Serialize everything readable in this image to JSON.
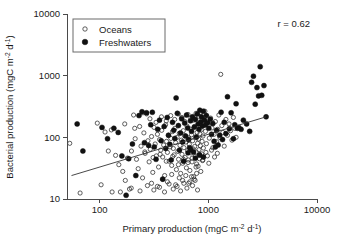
{
  "chart_data": {
    "type": "scatter",
    "title": "",
    "xlabel": "Primary production (mgC m-2 d-1)",
    "ylabel": "Bacterial production (mgC m-2 d-1)",
    "xlabel_parts": {
      "main": "Primary production (mgC m",
      "sup1": "-2",
      "mid": " d",
      "sup2": "-1",
      "end": ")"
    },
    "ylabel_parts": {
      "main": "Bacterial production (mgC m",
      "sup1": "-2",
      "mid": " d",
      "sup2": "-1",
      "end": ")"
    },
    "xscale": "log",
    "yscale": "log",
    "xlim": [
      50,
      10000
    ],
    "ylim": [
      10,
      10000
    ],
    "xticks": [
      100,
      1000,
      10000
    ],
    "xtick_labels": [
      "100",
      "1000",
      "10000"
    ],
    "yticks": [
      10,
      100,
      1000,
      10000
    ],
    "ytick_labels": [
      "10",
      "100",
      "1000",
      "10000"
    ],
    "grid": false,
    "legend_position": "top-left",
    "annotation": "r = 0.62",
    "correlation_r": 0.62,
    "marker_colors": {
      "oceans": "#ffffff",
      "freshwaters": "#111111",
      "edge": "#2b2b2b",
      "fitline": "#333333"
    },
    "fit_line": {
      "x": [
        55,
        3400
      ],
      "y": [
        24,
        215
      ],
      "label": "regression line"
    },
    "series": [
      {
        "name": "Oceans",
        "marker": "open-circle",
        "points": [
          [
            53,
            80
          ],
          [
            66,
            12.5
          ],
          [
            95,
            170
          ],
          [
            103,
            17
          ],
          [
            112,
            122
          ],
          [
            120,
            60
          ],
          [
            128,
            132
          ],
          [
            140,
            51
          ],
          [
            150,
            36
          ],
          [
            163,
            28
          ],
          [
            172,
            20
          ],
          [
            180,
            46
          ],
          [
            188,
            14.5
          ],
          [
            196,
            60
          ],
          [
            205,
            230
          ],
          [
            212,
            95
          ],
          [
            218,
            44
          ],
          [
            226,
            31
          ],
          [
            233,
            150
          ],
          [
            240,
            72
          ],
          [
            248,
            22
          ],
          [
            255,
            118
          ],
          [
            262,
            55
          ],
          [
            270,
            240
          ],
          [
            278,
            88
          ],
          [
            285,
            40
          ],
          [
            292,
            64
          ],
          [
            300,
            103
          ],
          [
            308,
            27
          ],
          [
            316,
            145
          ],
          [
            324,
            78
          ],
          [
            332,
            50
          ],
          [
            340,
            112
          ],
          [
            348,
            33
          ],
          [
            356,
            92
          ],
          [
            364,
            62
          ],
          [
            372,
            130
          ],
          [
            380,
            48
          ],
          [
            388,
            75
          ],
          [
            396,
            24
          ],
          [
            404,
            160
          ],
          [
            412,
            86
          ],
          [
            420,
            57
          ],
          [
            428,
            108
          ],
          [
            436,
            41
          ],
          [
            444,
            70
          ],
          [
            452,
            96
          ],
          [
            460,
            35
          ],
          [
            468,
            124
          ],
          [
            476,
            66
          ],
          [
            484,
            52
          ],
          [
            492,
            140
          ],
          [
            500,
            82
          ],
          [
            508,
            30
          ],
          [
            516,
            100
          ],
          [
            524,
            59
          ],
          [
            532,
            44
          ],
          [
            540,
            116
          ],
          [
            548,
            74
          ],
          [
            556,
            26
          ],
          [
            564,
            90
          ],
          [
            572,
            53
          ],
          [
            580,
            38
          ],
          [
            588,
            128
          ],
          [
            596,
            68
          ],
          [
            604,
            106
          ],
          [
            612,
            47
          ],
          [
            620,
            84
          ],
          [
            628,
            32
          ],
          [
            636,
            152
          ],
          [
            644,
            61
          ],
          [
            652,
            43
          ],
          [
            660,
            98
          ],
          [
            668,
            77
          ],
          [
            676,
            29
          ],
          [
            684,
            136
          ],
          [
            692,
            56
          ],
          [
            700,
            110
          ],
          [
            708,
            40
          ],
          [
            716,
            88
          ],
          [
            724,
            65
          ],
          [
            732,
            23
          ],
          [
            740,
            144
          ],
          [
            748,
            71
          ],
          [
            756,
            49
          ],
          [
            764,
            102
          ],
          [
            772,
            58
          ],
          [
            780,
            37
          ],
          [
            788,
            120
          ],
          [
            796,
            80
          ],
          [
            804,
            34
          ],
          [
            812,
            94
          ],
          [
            820,
            63
          ],
          [
            828,
            45
          ],
          [
            836,
            114
          ],
          [
            844,
            73
          ],
          [
            852,
            28
          ],
          [
            860,
            132
          ],
          [
            868,
            54
          ],
          [
            876,
            86
          ],
          [
            884,
            42
          ],
          [
            892,
            105
          ],
          [
            900,
            67
          ],
          [
            920,
            190
          ],
          [
            940,
            125
          ],
          [
            960,
            79
          ],
          [
            980,
            50
          ],
          [
            1000,
            160
          ],
          [
            1020,
            97
          ],
          [
            1050,
            205
          ],
          [
            1080,
            142
          ],
          [
            1100,
            68
          ],
          [
            1130,
            112
          ],
          [
            1160,
            180
          ],
          [
            1190,
            85
          ],
          [
            1220,
            135
          ],
          [
            1250,
            230
          ],
          [
            1280,
            99
          ],
          [
            1300,
            1050
          ],
          [
            1330,
            155
          ],
          [
            1360,
            120
          ],
          [
            1400,
            72
          ],
          [
            1450,
            195
          ],
          [
            1500,
            108
          ],
          [
            1550,
            165
          ],
          [
            1600,
            128
          ],
          [
            1650,
            90
          ],
          [
            1700,
            210
          ],
          [
            1750,
            140
          ],
          [
            1800,
            100
          ],
          [
            300,
            18
          ],
          [
            340,
            16
          ],
          [
            380,
            21
          ],
          [
            420,
            19
          ],
          [
            460,
            25
          ],
          [
            500,
            17
          ],
          [
            540,
            22
          ],
          [
            580,
            20
          ],
          [
            620,
            24
          ],
          [
            660,
            18
          ],
          [
            700,
            23
          ],
          [
            740,
            21
          ],
          [
            780,
            26
          ],
          [
            250,
            250
          ],
          [
            290,
            200
          ],
          [
            330,
            175
          ],
          [
            370,
            215
          ],
          [
            410,
            185
          ],
          [
            450,
            225
          ],
          [
            490,
            195
          ],
          [
            530,
            240
          ],
          [
            570,
            210
          ],
          [
            610,
            180
          ],
          [
            650,
            235
          ],
          [
            690,
            205
          ],
          [
            730,
            190
          ],
          [
            770,
            245
          ],
          [
            810,
            220
          ],
          [
            850,
            255
          ],
          [
            890,
            198
          ],
          [
            930,
            265
          ],
          [
            155,
            13
          ],
          [
            195,
            15
          ],
          [
            235,
            13.5
          ],
          [
            275,
            16.5
          ],
          [
            315,
            14
          ],
          [
            355,
            15.5
          ],
          [
            395,
            13
          ],
          [
            435,
            17.5
          ],
          [
            475,
            14.5
          ],
          [
            515,
            16
          ],
          [
            555,
            13.5
          ],
          [
            595,
            18
          ],
          [
            635,
            15
          ],
          [
            675,
            19
          ],
          [
            715,
            16.5
          ],
          [
            755,
            20
          ],
          [
            795,
            14
          ],
          [
            130,
            13
          ],
          [
            170,
            165
          ],
          [
            210,
            140
          ],
          [
            260,
            58
          ],
          [
            310,
            47
          ],
          [
            360,
            53
          ],
          [
            410,
            41
          ],
          [
            470,
            49
          ],
          [
            530,
            36
          ],
          [
            590,
            44
          ],
          [
            650,
            39
          ],
          [
            710,
            46
          ],
          [
            770,
            33
          ],
          [
            830,
            51
          ],
          [
            890,
            43
          ],
          [
            950,
            57
          ],
          [
            1010,
            38
          ],
          [
            1070,
            62
          ],
          [
            1140,
            48
          ],
          [
            1210,
            55
          ]
        ]
      },
      {
        "name": "Freshwaters",
        "marker": "filled-circle",
        "points": [
          [
            62,
            165
          ],
          [
            70,
            60
          ],
          [
            105,
            145
          ],
          [
            118,
            95
          ],
          [
            135,
            140
          ],
          [
            148,
            120
          ],
          [
            160,
            50
          ],
          [
            175,
            11.5
          ],
          [
            185,
            45
          ],
          [
            200,
            78
          ],
          [
            215,
            24
          ],
          [
            230,
            225
          ],
          [
            245,
            260
          ],
          [
            258,
            82
          ],
          [
            270,
            250
          ],
          [
            282,
            74
          ],
          [
            295,
            160
          ],
          [
            305,
            255
          ],
          [
            318,
            70
          ],
          [
            330,
            44
          ],
          [
            342,
            135
          ],
          [
            355,
            190
          ],
          [
            368,
            88
          ],
          [
            380,
            21
          ],
          [
            392,
            150
          ],
          [
            405,
            66
          ],
          [
            418,
            210
          ],
          [
            430,
            108
          ],
          [
            442,
            77
          ],
          [
            455,
            43
          ],
          [
            468,
            175
          ],
          [
            480,
            130
          ],
          [
            492,
            96
          ],
          [
            505,
            435
          ],
          [
            518,
            245
          ],
          [
            530,
            155
          ],
          [
            542,
            62
          ],
          [
            555,
            118
          ],
          [
            568,
            200
          ],
          [
            580,
            84
          ],
          [
            592,
            41
          ],
          [
            605,
            170
          ],
          [
            618,
            105
          ],
          [
            630,
            230
          ],
          [
            645,
            142
          ],
          [
            658,
            92
          ],
          [
            672,
            68
          ],
          [
            685,
            185
          ],
          [
            700,
            125
          ],
          [
            715,
            215
          ],
          [
            730,
            58
          ],
          [
            745,
            148
          ],
          [
            760,
            195
          ],
          [
            775,
            100
          ],
          [
            790,
            240
          ],
          [
            805,
            165
          ],
          [
            820,
            135
          ],
          [
            835,
            275
          ],
          [
            850,
            178
          ],
          [
            865,
            215
          ],
          [
            880,
            152
          ],
          [
            900,
            265
          ],
          [
            920,
            190
          ],
          [
            940,
            158
          ],
          [
            960,
            225
          ],
          [
            985,
            172
          ],
          [
            1010,
            140
          ],
          [
            1040,
            196
          ],
          [
            1070,
            112
          ],
          [
            1100,
            168
          ],
          [
            1130,
            86
          ],
          [
            1160,
            70
          ],
          [
            1190,
            130
          ],
          [
            1230,
            75
          ],
          [
            1270,
            108
          ],
          [
            1310,
            255
          ],
          [
            1350,
            92
          ],
          [
            1400,
            175
          ],
          [
            1450,
            115
          ],
          [
            1500,
            455
          ],
          [
            1560,
            138
          ],
          [
            1620,
            250
          ],
          [
            1700,
            95
          ],
          [
            1800,
            350
          ],
          [
            1900,
            145
          ],
          [
            2000,
            135
          ],
          [
            2100,
            190
          ],
          [
            2250,
            165
          ],
          [
            2400,
            125
          ],
          [
            2500,
            780
          ],
          [
            2600,
            980
          ],
          [
            2700,
            345
          ],
          [
            2800,
            640
          ],
          [
            2900,
            470
          ],
          [
            3000,
            1400
          ],
          [
            3100,
            480
          ],
          [
            3250,
            690
          ],
          [
            3400,
            215
          ],
          [
            1750,
            160
          ],
          [
            1850,
            140
          ],
          [
            650,
            56
          ],
          [
            690,
            63
          ],
          [
            760,
            46
          ],
          [
            830,
            52
          ],
          [
            900,
            48
          ]
        ]
      }
    ]
  },
  "legend": {
    "entries": [
      {
        "label": "Oceans",
        "marker": "open-circle"
      },
      {
        "label": "Freshwaters",
        "marker": "filled-circle"
      }
    ]
  }
}
